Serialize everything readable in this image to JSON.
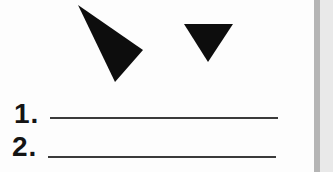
{
  "worksheet": {
    "background": "#fdfdfd",
    "shapes": {
      "fill_color": "#0d0d0d",
      "items": [
        {
          "name": "large-triangle",
          "description": "large black triangle tilted, pointing toward lower right"
        },
        {
          "name": "small-triangle",
          "description": "small black triangle pointing down"
        }
      ]
    },
    "questions": [
      {
        "number": "1.",
        "answer_value": ""
      },
      {
        "number": "2.",
        "answer_value": ""
      }
    ],
    "blank_line_color": "#3b3b3b",
    "page_edge": {
      "band_color": "#b5b5b5",
      "margin_color": "#e9e9e9"
    }
  }
}
